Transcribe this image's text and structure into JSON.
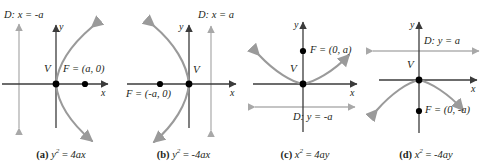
{
  "figure": {
    "colors": {
      "axis": "#3b3b3b",
      "curve": "#9a9a9a",
      "directrix": "#b0b0b0",
      "point": "#000000",
      "text": "#231f20",
      "background": "#ffffff"
    }
  },
  "panels": [
    {
      "id": "a",
      "tag": "(a)",
      "equation_plain": "y2 = 4ax",
      "equation": {
        "lhs_base": "y",
        "lhs_exp": "2",
        "rhs": "4ax"
      },
      "opens": "right",
      "directrix_label": "D: x = -a",
      "directrix_prefix": "D:",
      "directrix_equation": "x = -a",
      "focus_label": "F = (a, 0)",
      "vertex_label": "V",
      "x_axis_label": "x",
      "y_axis_label": "y",
      "focus_point": "(a, 0)",
      "vertex_point": "(0, 0)"
    },
    {
      "id": "b",
      "tag": "(b)",
      "equation_plain": "y2 = -4ax",
      "equation": {
        "lhs_base": "y",
        "lhs_exp": "2",
        "rhs": "-4ax"
      },
      "opens": "left",
      "directrix_label": "D: x = a",
      "directrix_prefix": "D:",
      "directrix_equation": "x = a",
      "focus_label": "F = (-a, 0)",
      "vertex_label": "V",
      "x_axis_label": "x",
      "y_axis_label": "y",
      "focus_point": "(-a, 0)",
      "vertex_point": "(0, 0)"
    },
    {
      "id": "c",
      "tag": "(c)",
      "equation_plain": "x2 = 4ay",
      "equation": {
        "lhs_base": "x",
        "lhs_exp": "2",
        "rhs": "4ay"
      },
      "opens": "up",
      "directrix_label": "D: y = -a",
      "directrix_prefix": "D:",
      "directrix_equation": "y = -a",
      "focus_label": "F = (0, a)",
      "vertex_label": "V",
      "x_axis_label": "x",
      "y_axis_label": "y",
      "focus_point": "(0, a)",
      "vertex_point": "(0, 0)"
    },
    {
      "id": "d",
      "tag": "(d)",
      "equation_plain": "x2 = -4ay",
      "equation": {
        "lhs_base": "x",
        "lhs_exp": "2",
        "rhs": "-4ay"
      },
      "opens": "down",
      "directrix_label": "D: y = a",
      "directrix_prefix": "D:",
      "directrix_equation": "y = a",
      "focus_label": "F = (0, -a)",
      "vertex_label": "V",
      "x_axis_label": "x",
      "y_axis_label": "y",
      "focus_point": "(0, -a)",
      "vertex_point": "(0, 0)"
    }
  ]
}
